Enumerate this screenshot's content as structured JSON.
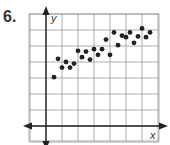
{
  "problem_number": "6.",
  "chart_data": {
    "type": "scatter",
    "title": "",
    "xlabel": "x",
    "ylabel": "y",
    "grid": true,
    "legend": null,
    "axis_ticks_labeled": false,
    "grid_units": {
      "x_range": [
        -1,
        7
      ],
      "y_range": [
        -1,
        7
      ]
    },
    "points": [
      {
        "x": 0.5,
        "y": 3.05
      },
      {
        "x": 0.75,
        "y": 4.2
      },
      {
        "x": 1.0,
        "y": 3.65
      },
      {
        "x": 1.25,
        "y": 4.0
      },
      {
        "x": 1.5,
        "y": 3.65
      },
      {
        "x": 1.75,
        "y": 3.9
      },
      {
        "x": 2.0,
        "y": 4.7
      },
      {
        "x": 2.25,
        "y": 4.3
      },
      {
        "x": 2.5,
        "y": 4.65
      },
      {
        "x": 2.75,
        "y": 4.15
      },
      {
        "x": 3.0,
        "y": 4.8
      },
      {
        "x": 3.25,
        "y": 4.45
      },
      {
        "x": 3.5,
        "y": 4.8
      },
      {
        "x": 3.75,
        "y": 5.4
      },
      {
        "x": 4.0,
        "y": 4.45
      },
      {
        "x": 4.25,
        "y": 5.85
      },
      {
        "x": 4.5,
        "y": 5.05
      },
      {
        "x": 4.75,
        "y": 5.65
      },
      {
        "x": 5.0,
        "y": 5.55
      },
      {
        "x": 5.25,
        "y": 5.85
      },
      {
        "x": 5.5,
        "y": 5.2
      },
      {
        "x": 5.75,
        "y": 5.6
      },
      {
        "x": 6.0,
        "y": 6.1
      },
      {
        "x": 6.25,
        "y": 5.55
      },
      {
        "x": 6.5,
        "y": 5.85
      }
    ],
    "trend": "positive linear correlation"
  },
  "colors": {
    "grid": "#9a9a9a",
    "axis": "#222222",
    "point": "#222222",
    "label": "#333333"
  }
}
